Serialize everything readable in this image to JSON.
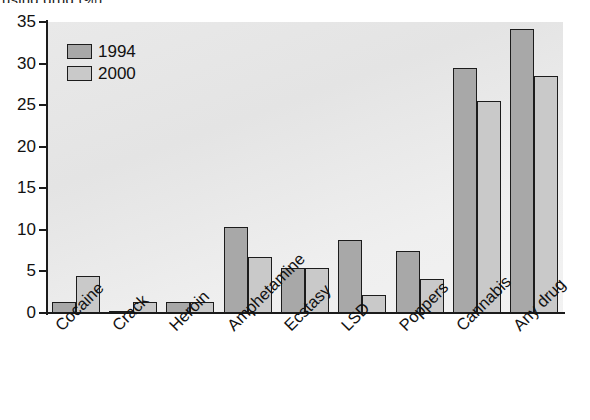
{
  "figure": {
    "clipped_title": "using drug (%)",
    "background": "#ffffff",
    "plot_background": "#e9e9e9"
  },
  "legend": {
    "position": "top-left-inside",
    "entries": [
      {
        "label": "1994",
        "color": "#a8a8a8"
      },
      {
        "label": "2000",
        "color": "#c9c9c9"
      }
    ]
  },
  "axes": {
    "y_ticks": [
      "35",
      "30",
      "25",
      "20",
      "15",
      "10",
      "5",
      "0"
    ],
    "x_label": "",
    "y_label": ""
  },
  "chart_data": {
    "type": "bar",
    "title": "using drug (%)",
    "xlabel": "",
    "ylabel": "using drug (%)",
    "ylim": [
      0,
      35
    ],
    "ytick_step": 5,
    "grid": false,
    "legend_position": "upper left",
    "categories": [
      "Cocaine",
      "Crack",
      "Heroin",
      "Amphetamine",
      "Ecstasy",
      "LSD",
      "Poppers",
      "Cannabis",
      "Any drug"
    ],
    "series": [
      {
        "name": "1994",
        "color": "#a8a8a8",
        "values": [
          1.3,
          0.1,
          1.3,
          10.4,
          5.4,
          8.8,
          7.5,
          29.5,
          34.2
        ]
      },
      {
        "name": "2000",
        "color": "#c9c9c9",
        "values": [
          4.5,
          1.3,
          1.3,
          6.7,
          5.4,
          2.2,
          4.1,
          25.5,
          28.5
        ]
      }
    ]
  }
}
